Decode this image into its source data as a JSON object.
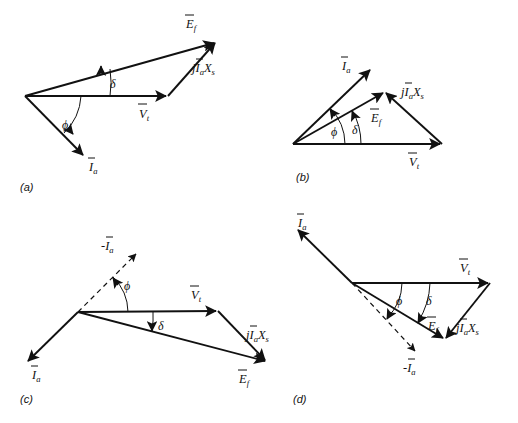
{
  "figure": {
    "background_color": "#ffffff",
    "line_color": "#111111",
    "width": 518,
    "height": 423
  },
  "panels": [
    {
      "id": "a",
      "caption": "(a)",
      "caption_pos": [
        20,
        191
      ],
      "origin": [
        25,
        96
      ],
      "description": "Generator, lagging power factor",
      "vectors": [
        {
          "name": "Vt",
          "label": "V",
          "sub": "t",
          "overbar": true,
          "prefix": "",
          "from": [
            25,
            96
          ],
          "to": [
            168,
            96
          ],
          "style": "solid",
          "label_pos": [
            139,
            114
          ],
          "arrow": true
        },
        {
          "name": "Ef",
          "label": "E",
          "sub": "f",
          "overbar": true,
          "prefix": "",
          "from": [
            25,
            96
          ],
          "to": [
            216,
            42
          ],
          "style": "solid",
          "label_pos": [
            186,
            24
          ],
          "arrow": true
        },
        {
          "name": "jIaXs",
          "label": "X",
          "sub": "s",
          "overbar": false,
          "prefix": "jIa",
          "from": [
            168,
            96
          ],
          "to": [
            216,
            42
          ],
          "style": "solid",
          "label_pos": [
            196,
            65
          ],
          "arrow": true
        },
        {
          "name": "Ia",
          "label": "I",
          "sub": "a",
          "overbar": true,
          "prefix": "",
          "from": [
            25,
            96
          ],
          "to": [
            85,
            157
          ],
          "style": "solid",
          "label_pos": [
            89,
            167
          ],
          "arrow": true
        }
      ],
      "angles": [
        {
          "name": "delta",
          "symbol": "δ",
          "label_pos": [
            112,
            84
          ],
          "arc": {
            "cx": 25,
            "cy": 96,
            "r": 85,
            "a0": -15.8,
            "a1": 0
          },
          "tick_end": [
            104,
            96
          ],
          "tick_start": [
            101,
            73
          ]
        },
        {
          "name": "phi",
          "symbol": "ϕ",
          "label_pos": [
            64,
            125
          ],
          "arc": {
            "cx": 25,
            "cy": 96,
            "r": 56,
            "a0": 0,
            "a1": 45.5
          },
          "tick_end": [
            64,
            135
          ],
          "tick_start": [
            81,
            96
          ]
        }
      ]
    },
    {
      "id": "b",
      "caption": "(b)",
      "caption_pos": [
        298,
        181
      ],
      "origin": [
        293,
        144
      ],
      "description": "Generator, leading power factor",
      "vectors": [
        {
          "name": "Vt",
          "label": "V",
          "sub": "t",
          "overbar": true,
          "prefix": "",
          "from": [
            293,
            144
          ],
          "to": [
            442,
            144
          ],
          "style": "solid",
          "label_pos": [
            411,
            162
          ],
          "arrow": true
        },
        {
          "name": "Ef",
          "label": "E",
          "sub": "f",
          "overbar": true,
          "prefix": "",
          "from": [
            293,
            144
          ],
          "to": [
            385,
            92
          ],
          "style": "solid",
          "label_pos": [
            375,
            114
          ],
          "arrow": true
        },
        {
          "name": "jIaXs",
          "label": "X",
          "sub": "s",
          "overbar": false,
          "prefix": "jIa",
          "from": [
            442,
            144
          ],
          "to": [
            385,
            92
          ],
          "style": "solid",
          "label_pos": [
            404,
            92
          ],
          "arrow": true
        },
        {
          "name": "Ia",
          "label": "I",
          "sub": "a",
          "overbar": true,
          "prefix": "",
          "from": [
            293,
            144
          ],
          "to": [
            372,
            68
          ],
          "style": "solid",
          "label_pos": [
            345,
            63
          ],
          "arrow": true
        }
      ],
      "angles": [
        {
          "name": "phi",
          "symbol": "ϕ",
          "label_pos": [
            336,
            131
          ],
          "arc": {
            "cx": 293,
            "cy": 144,
            "r": 52,
            "a0": -43.9,
            "a1": 0
          },
          "tick_end": [
            341,
            144
          ],
          "tick_start": [
            330,
            108
          ]
        },
        {
          "name": "delta",
          "symbol": "δ",
          "label_pos": [
            355,
            131
          ],
          "arc": {
            "cx": 293,
            "cy": 144,
            "r": 68,
            "a0": -29.5,
            "a1": 0
          },
          "tick_end": [
            360,
            144
          ],
          "tick_start": [
            350,
            111
          ]
        }
      ]
    },
    {
      "id": "c",
      "caption": "(c)",
      "caption_pos": [
        20,
        403
      ],
      "origin": [
        78,
        312
      ],
      "description": "Motor, leading power factor",
      "vectors": [
        {
          "name": "Vt",
          "label": "V",
          "sub": "t",
          "overbar": true,
          "prefix": "",
          "from": [
            78,
            312
          ],
          "to": [
            218,
            311
          ],
          "style": "solid",
          "label_pos": [
            193,
            295
          ],
          "arrow": true
        },
        {
          "name": "Ef",
          "label": "E",
          "sub": "f",
          "overbar": true,
          "prefix": "",
          "from": [
            78,
            312
          ],
          "to": [
            267,
            362
          ],
          "style": "solid",
          "label_pos": [
            242,
            378
          ],
          "arrow": true
        },
        {
          "name": "jIaXs",
          "label": "X",
          "sub": "s",
          "overbar": false,
          "prefix": "jIa",
          "from": [
            218,
            311
          ],
          "to": [
            267,
            362
          ],
          "style": "solid",
          "label_pos": [
            249,
            332
          ],
          "arrow": true
        },
        {
          "name": "Ia",
          "label": "I",
          "sub": "a",
          "overbar": true,
          "prefix": "",
          "from": [
            78,
            312
          ],
          "to": [
            26,
            363
          ],
          "style": "solid",
          "label_pos": [
            34,
            375
          ],
          "arrow": true
        },
        {
          "name": "minusIa",
          "label": "I",
          "sub": "a",
          "overbar": true,
          "prefix": "-",
          "from": [
            78,
            312
          ],
          "to": [
            138,
            252
          ],
          "style": "dashed",
          "label_pos": [
            109,
            246
          ],
          "arrow": true
        }
      ],
      "angles": [
        {
          "name": "phi",
          "symbol": "ϕ",
          "label_pos": [
            127,
            285
          ],
          "arc": {
            "cx": 78,
            "cy": 312,
            "r": 50,
            "a0": -45,
            "a1": 0
          },
          "tick_end": [
            128,
            312
          ],
          "tick_start": [
            112,
            277
          ]
        },
        {
          "name": "delta",
          "symbol": "δ",
          "label_pos": [
            159,
            324
          ],
          "arc": {
            "cx": 78,
            "cy": 312,
            "r": 75,
            "a0": 0,
            "a1": 14.8
          },
          "tick_end": [
            152,
            331
          ],
          "tick_start": [
            153,
            311
          ]
        }
      ]
    },
    {
      "id": "d",
      "caption": "(d)",
      "caption_pos": [
        293,
        403
      ],
      "origin": [
        352,
        283
      ],
      "description": "Motor, lagging power factor",
      "vectors": [
        {
          "name": "Vt",
          "label": "V",
          "sub": "t",
          "overbar": true,
          "prefix": "",
          "from": [
            352,
            283
          ],
          "to": [
            490,
            283
          ],
          "style": "solid",
          "label_pos": [
            462,
            268
          ],
          "arrow": true
        },
        {
          "name": "Ef",
          "label": "E",
          "sub": "f",
          "overbar": true,
          "prefix": "",
          "from": [
            352,
            283
          ],
          "to": [
            445,
            340
          ],
          "style": "solid",
          "label_pos": [
            432,
            323
          ],
          "arrow": true
        },
        {
          "name": "jIaXs",
          "label": "X",
          "sub": "s",
          "overbar": false,
          "prefix": "jIa",
          "from": [
            490,
            283
          ],
          "to": [
            445,
            340
          ],
          "style": "solid",
          "label_pos": [
            459,
            325
          ],
          "arrow": true
        },
        {
          "name": "Ia",
          "label": "I",
          "sub": "a",
          "overbar": true,
          "prefix": "",
          "from": [
            352,
            283
          ],
          "to": [
            296,
            228
          ],
          "style": "solid",
          "label_pos": [
            301,
            222
          ],
          "arrow": true
        },
        {
          "name": "minusIa",
          "label": "I",
          "sub": "a",
          "overbar": true,
          "prefix": "-",
          "from": [
            352,
            283
          ],
          "to": [
            417,
            353
          ],
          "style": "dashed",
          "label_pos": [
            412,
            368
          ],
          "arrow": true
        }
      ],
      "angles": [
        {
          "name": "phi",
          "symbol": "ϕ",
          "label_pos": [
            398,
            300
          ],
          "arc": {
            "cx": 352,
            "cy": 283,
            "r": 50,
            "a0": 0,
            "a1": 45
          },
          "tick_end": [
            386,
            318
          ],
          "tick_start": [
            402,
            283
          ]
        },
        {
          "name": "delta",
          "symbol": "δ",
          "label_pos": [
            428,
            302
          ],
          "arc": {
            "cx": 352,
            "cy": 283,
            "r": 78,
            "a0": 0,
            "a1": 31.5
          },
          "tick_end": [
            419,
            323
          ],
          "tick_start": [
            430,
            283
          ]
        }
      ]
    }
  ],
  "symbols": {
    "phi": "ϕ",
    "delta": "δ",
    "j": "j",
    "minus": "-"
  }
}
